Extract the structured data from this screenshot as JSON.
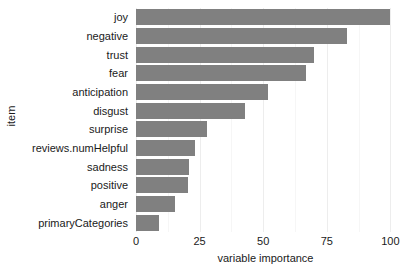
{
  "chart_data": {
    "type": "bar",
    "orientation": "horizontal",
    "title": "",
    "xlabel": "variable importance",
    "ylabel": "item",
    "categories": [
      "joy",
      "negative",
      "trust",
      "fear",
      "anticipation",
      "disgust",
      "surprise",
      "reviews.numHelpful",
      "sadness",
      "positive",
      "anger",
      "primaryCategories"
    ],
    "values": [
      100,
      83,
      70,
      67,
      52,
      43,
      28,
      23,
      21,
      20.5,
      15.5,
      9
    ],
    "xlim": [
      0,
      103
    ],
    "xticks": [
      0,
      25,
      50,
      75,
      100
    ],
    "xticklabels": [
      "0",
      "25",
      "50",
      "75",
      "100"
    ],
    "minor_xticks": [
      12.5,
      37.5,
      62.5,
      87.5
    ],
    "grid": true,
    "legend": false,
    "bar_color": "#808080",
    "grid_color": "#ededed",
    "minor_grid_color": "#f6f6f6",
    "background": "#ffffff",
    "text_color": "#1a1a1a"
  }
}
